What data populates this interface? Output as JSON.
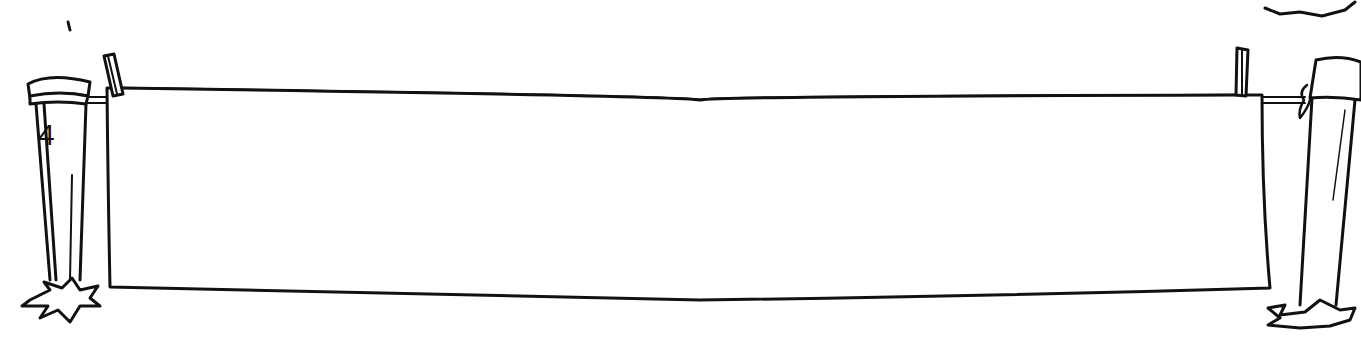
{
  "illustration": {
    "subject": "clothesline-banner",
    "post_label": "4",
    "banner_text": "",
    "colors": {
      "ink": "#111111",
      "paper": "#ffffff"
    }
  }
}
